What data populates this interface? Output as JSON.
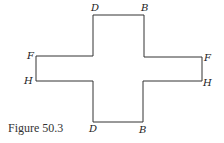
{
  "figure": {
    "caption": "Figure 50.3",
    "stroke_color": "#333333",
    "labels": {
      "top_left": "D",
      "top_right": "B",
      "left_upper": "F",
      "left_lower": "H",
      "right_upper": "F",
      "right_lower": "H",
      "bottom_left": "D",
      "bottom_right": "B"
    }
  }
}
